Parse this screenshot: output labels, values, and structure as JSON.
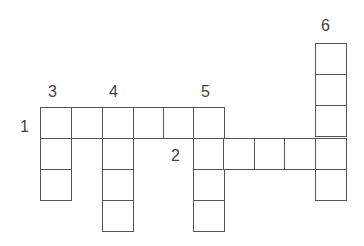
{
  "puzzle": {
    "type": "crossword",
    "cell_size": 31,
    "border_color": "#555555",
    "label_color": "#444444",
    "labels": [
      {
        "text": "1",
        "x": 20,
        "y": 119
      },
      {
        "text": "2",
        "x": 171,
        "y": 148
      },
      {
        "text": "3",
        "x": 48,
        "y": 84
      },
      {
        "text": "4",
        "x": 109,
        "y": 84
      },
      {
        "text": "5",
        "x": 201,
        "y": 84
      },
      {
        "text": "6",
        "x": 321,
        "y": 18
      }
    ],
    "words": [
      {
        "number": "1",
        "direction": "across",
        "length": 6
      },
      {
        "number": "2",
        "direction": "across",
        "length": 5
      },
      {
        "number": "3",
        "direction": "down",
        "length": 3
      },
      {
        "number": "4",
        "direction": "down",
        "length": 4
      },
      {
        "number": "5",
        "direction": "down",
        "length": 4
      },
      {
        "number": "6",
        "direction": "down",
        "length": 5
      }
    ],
    "cells": [
      [
        40,
        107
      ],
      [
        71,
        107
      ],
      [
        102,
        107
      ],
      [
        133,
        107
      ],
      [
        163,
        107
      ],
      [
        193,
        107
      ],
      [
        40,
        138
      ],
      [
        40,
        169
      ],
      [
        102,
        138
      ],
      [
        102,
        169
      ],
      [
        102,
        200
      ],
      [
        193,
        138
      ],
      [
        193,
        169
      ],
      [
        193,
        200
      ],
      [
        223,
        138
      ],
      [
        254,
        138
      ],
      [
        284,
        138
      ],
      [
        315,
        138
      ],
      [
        315,
        43
      ],
      [
        315,
        74
      ],
      [
        315,
        105
      ],
      [
        315,
        169
      ]
    ]
  }
}
